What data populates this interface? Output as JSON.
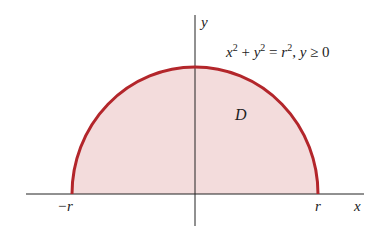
{
  "diagram": {
    "equation": {
      "x": "x",
      "sq1": "2",
      "plus": " + ",
      "y": "y",
      "sq2": "2",
      "eq": " = ",
      "r": "r",
      "sq3": "2",
      "cond": ", ",
      "y2": "y",
      "ge": " ≥ 0"
    },
    "region_label": "D",
    "axis_x_label": "x",
    "axis_y_label": "y",
    "tick_left": "−r",
    "tick_right": "r",
    "colors": {
      "curve": "#b3262b",
      "fill": "#f3dcdc",
      "axis": "#222222"
    }
  }
}
